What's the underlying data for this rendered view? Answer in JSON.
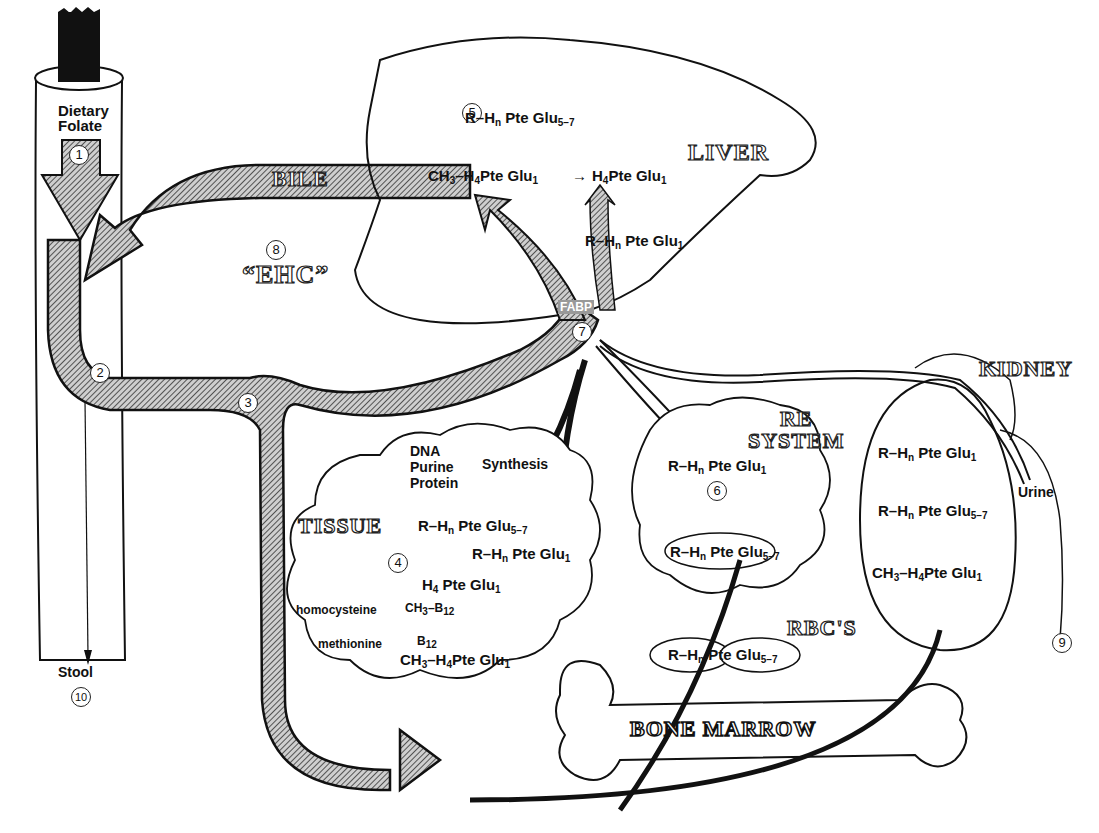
{
  "organs": {
    "liver": "LIVER",
    "kidney": "KIDNEY",
    "re_system": [
      "RE",
      "SYSTEM"
    ],
    "tissue": "TISSUE",
    "rbcs": "RBC'S",
    "bone_marrow": "BONE MARROW",
    "bile": "BILE",
    "ehc": "“EHC”"
  },
  "gut": {
    "dietary": "Dietary",
    "folate": "Folate",
    "stool": "Stool",
    "fabp": "FABP",
    "urine": "Urine"
  },
  "steps": [
    "1",
    "2",
    "3",
    "4",
    "5",
    "6",
    "7",
    "8",
    "9",
    "10"
  ],
  "liver_chem": {
    "top": "R–H",
    "top_n": "n",
    "top_rest": " Pte Glu",
    "top_sub": "5–7",
    "methyl": "CH",
    "methyl_3": "3",
    "methyl_rest": "–H",
    "methyl_4": "4",
    "methyl_tail": "Pte Glu",
    "methyl_sub": "1",
    "arrow": "→",
    "h4": "H",
    "h4_4": "4",
    "h4_tail": "Pte Glu",
    "h4_sub": "1",
    "mono": "R–H",
    "mono_n": "n",
    "mono_rest": " Pte Glu",
    "mono_sub": "1"
  },
  "tissue_chem": {
    "synthesis_items": [
      "DNA",
      "Purine",
      "Protein"
    ],
    "synthesis": "Synthesis",
    "poly": "R–H",
    "poly_n": "n",
    "poly_rest": " Pte Glu",
    "poly_sub": "5–7",
    "mono": "R–H",
    "mono_n": "n",
    "mono_rest": " Pte Glu",
    "mono_sub": "1",
    "h4": "H",
    "h4_4": "4",
    "h4_tail": " Pte Glu",
    "h4_sub": "1",
    "homocysteine": "homocysteine",
    "methionine": "methionine",
    "ch3b12": "CH",
    "ch3b12_3": "3",
    "ch3b12_rest": "–B",
    "ch3b12_12": "12",
    "b12": "B",
    "b12_12": "12",
    "methyl": "CH",
    "methyl_3": "3",
    "methyl_rest": "–H",
    "methyl_4": "4",
    "methyl_tail": "Pte Glu",
    "methyl_sub": "1"
  },
  "re_chem": {
    "mono": "R–H",
    "mono_n": "n",
    "mono_rest": " Pte Glu",
    "mono_sub": "1",
    "poly": "R–H",
    "poly_n": "n",
    "poly_rest": " Pte Glu",
    "poly_sub": "5–7"
  },
  "rbc_chem": {
    "poly": "R–H",
    "poly_n": "n",
    "poly_rest": " Pte Glu",
    "poly_sub": "5–7"
  },
  "kidney_chem": {
    "mono": "R–H",
    "mono_n": "n",
    "mono_rest": " Pte Glu",
    "mono_sub": "1",
    "poly": "R–H",
    "poly_n": "n",
    "poly_rest": " Pte Glu",
    "poly_sub": "5–7",
    "methyl": "CH",
    "methyl_3": "3",
    "methyl_rest": "–H",
    "methyl_4": "4",
    "methyl_tail": "Pte Glu",
    "methyl_sub": "1"
  },
  "colors": {
    "ink": "#111111",
    "hatch_fill": "#8a8a8a",
    "paper": "#ffffff"
  }
}
